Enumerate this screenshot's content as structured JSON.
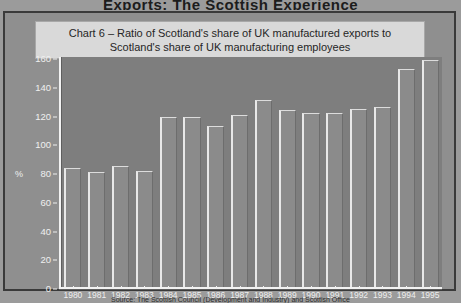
{
  "page": {
    "heading_partial": "Exports: The Scottish Experience",
    "source_partial": "Source: The Scottish Council (Development and Industry) and Scottish Office"
  },
  "chart_data": {
    "type": "bar",
    "title": "Chart 6 – Ratio of Scotland's share of UK manufactured exports to Scotland's share of UK manufacturing employees",
    "title_line1": "Chart 6 – Ratio of Scotland's share of UK manufactured exports to",
    "title_line2": "Scotland's share of UK manufacturing employees",
    "xlabel": "",
    "ylabel": "%",
    "ylim": [
      0,
      160
    ],
    "yticks": [
      0,
      20,
      40,
      60,
      80,
      100,
      120,
      140,
      160
    ],
    "ytick_labels": [
      "0",
      "20",
      "40",
      "60",
      "80",
      "100",
      "120",
      "140",
      "160"
    ],
    "grid": false,
    "legend": "none",
    "categories": [
      "1980",
      "1981",
      "1982",
      "1983",
      "1984",
      "1985",
      "1986",
      "1987",
      "1988",
      "1989",
      "1990",
      "1991",
      "1992",
      "1993",
      "1994",
      "1995"
    ],
    "values": [
      83,
      80,
      84,
      81,
      118,
      118,
      112,
      120,
      130,
      123,
      121,
      121,
      124,
      125,
      152,
      158
    ],
    "series": [
      {
        "name": "Ratio of Scotland's share of UK manufactured exports to Scotland's share of UK manufacturing employees",
        "values": [
          83,
          80,
          84,
          81,
          118,
          118,
          112,
          120,
          130,
          123,
          121,
          121,
          124,
          125,
          152,
          158
        ]
      }
    ],
    "colors": {
      "bar_face": "#8b8b8b",
      "bar_highlight": "#e8e8e8",
      "plot_background": "#7e7e7e",
      "figure_background": "#8f8f8f",
      "title_plaque": "#d9d9d9",
      "axis": "#f2f2f2",
      "frame": "#3a3a3a"
    }
  }
}
